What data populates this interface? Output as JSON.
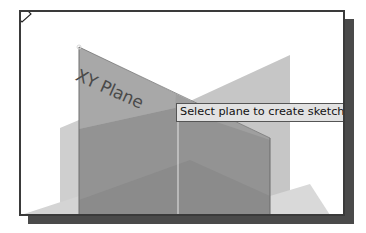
{
  "scene": {
    "plane_label": "XY Plane",
    "colors": {
      "background": "#ffffff",
      "frame_border": "#3a3a3a",
      "frame_shadow": "#4a4a4a",
      "light_plane": "#c8c8c8",
      "xy_plane": "#9c9c9c",
      "overlap_band": "#8e8e8e",
      "tooltip_bg": "#e2e2e2"
    }
  },
  "tooltip": {
    "text": "Select plane to create sketch or"
  },
  "cursor": {
    "icon": "arrow-pointer-with-sketch-icon"
  }
}
